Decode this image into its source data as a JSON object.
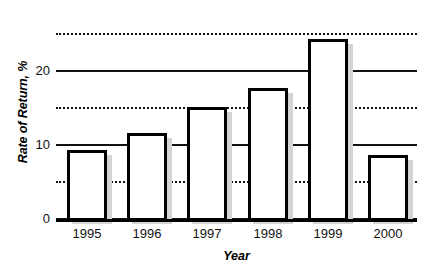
{
  "chart_data": {
    "type": "bar",
    "title": "",
    "xlabel": "Year",
    "ylabel": "Rate of Return, %",
    "categories": [
      "1995",
      "1996",
      "1997",
      "1998",
      "1999",
      "2000"
    ],
    "values": [
      9.3,
      11.6,
      15.2,
      17.7,
      24.3,
      8.6
    ],
    "ylim": [
      0,
      26
    ],
    "xlim_note": "categorical",
    "y_ticks": [
      0,
      10,
      20
    ],
    "y_tick_labels": [
      "0",
      "10",
      "20"
    ],
    "gridlines": [
      {
        "value": 0,
        "style": "solid"
      },
      {
        "value": 5,
        "style": "dotted"
      },
      {
        "value": 10,
        "style": "solid"
      },
      {
        "value": 15,
        "style": "dotted"
      },
      {
        "value": 20,
        "style": "solid"
      },
      {
        "value": 25,
        "style": "dotted"
      }
    ],
    "grid": true,
    "legend": null,
    "legend_position": "none",
    "annotations": [],
    "colors": {
      "bar_fill": "#ffffff",
      "bar_outline": "#000000",
      "bar_shadow": "#d4d4d4",
      "gridline": "#111111",
      "text": "#000000",
      "background": "#ffffff"
    }
  },
  "axes": {
    "y_title": "Rate of Return, %",
    "x_title": "Year"
  }
}
